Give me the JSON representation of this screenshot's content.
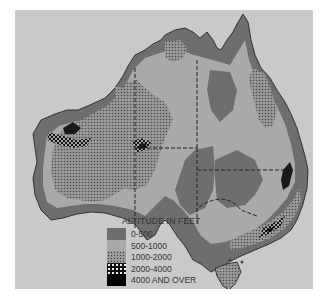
{
  "map": {
    "subject": "Australia",
    "type": "relief / altitude map",
    "colors": {
      "sea": "#c9c9c9",
      "band_0_500": "#6e6e6e",
      "band_500_1000": "#a9a9a9",
      "band_1000_2000": "#8f8f8f",
      "band_2000_4000": "#1a1a1a",
      "band_4000_over": "#000000",
      "borders": "#222222"
    }
  },
  "legend": {
    "title": "ALTITUDE IN FEET",
    "items": [
      {
        "label": "0-500",
        "pattern": "solid-dark-gray"
      },
      {
        "label": "500-1000",
        "pattern": "solid-light-gray"
      },
      {
        "label": "1000-2000",
        "pattern": "fine-dot-stipple"
      },
      {
        "label": "2000-4000",
        "pattern": "white-dots-on-black"
      },
      {
        "label": "4000 AND OVER",
        "pattern": "solid-black"
      }
    ]
  }
}
